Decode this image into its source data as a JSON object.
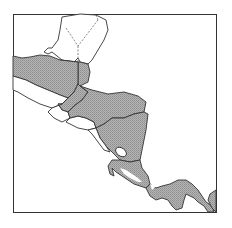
{
  "map": {
    "region": "Central America",
    "frame": {
      "x": 13,
      "y": 14,
      "width": 204,
      "height": 199
    },
    "colors": {
      "background": "#ffffff",
      "land_unshaded": "#ffffff",
      "land_shaded": "#aaaaaa",
      "border": "#333333",
      "frame": "#333333",
      "internal_dashed": "#555555"
    },
    "legend": null,
    "labels": []
  }
}
